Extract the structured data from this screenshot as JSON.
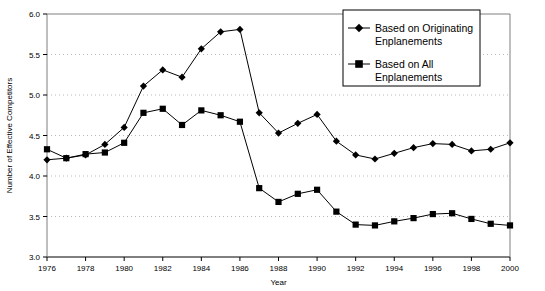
{
  "chart_data": {
    "type": "line",
    "title": "",
    "xlabel": "Year",
    "ylabel": "Number of Effective Competitors",
    "xlim": [
      1976,
      2000
    ],
    "ylim": [
      3.0,
      6.0
    ],
    "yticks": [
      "3.0",
      "3.5",
      "4.0",
      "4.5",
      "5.0",
      "5.5",
      "6.0"
    ],
    "ytick_values": [
      3.0,
      3.5,
      4.0,
      4.5,
      5.0,
      5.5,
      6.0
    ],
    "xticks": [
      "1976",
      "1978",
      "1980",
      "1982",
      "1984",
      "1986",
      "1988",
      "1990",
      "1992",
      "1994",
      "1996",
      "1998",
      "2000"
    ],
    "xtick_values": [
      1976,
      1978,
      1980,
      1982,
      1984,
      1986,
      1988,
      1990,
      1992,
      1994,
      1996,
      1998,
      2000
    ],
    "grid": "horizontal-dotted",
    "legend_position": "top-right",
    "x": [
      1976,
      1977,
      1978,
      1979,
      1980,
      1981,
      1982,
      1983,
      1984,
      1985,
      1986,
      1987,
      1988,
      1989,
      1990,
      1991,
      1992,
      1993,
      1994,
      1995,
      1996,
      1997,
      1998,
      1999,
      2000
    ],
    "series": [
      {
        "name": "Based on Originating Enplanements",
        "marker": "diamond",
        "color": "#000000",
        "values": [
          4.2,
          4.22,
          4.26,
          4.39,
          4.6,
          5.11,
          5.31,
          5.22,
          5.57,
          5.78,
          5.81,
          4.78,
          4.53,
          4.65,
          4.76,
          4.43,
          4.26,
          4.21,
          4.28,
          4.35,
          4.4,
          4.39,
          4.31,
          4.33,
          4.41
        ]
      },
      {
        "name": "Based on All Enplanements",
        "marker": "square",
        "color": "#000000",
        "values": [
          4.33,
          4.22,
          4.27,
          4.29,
          4.41,
          4.78,
          4.83,
          4.63,
          4.81,
          4.75,
          4.67,
          3.85,
          3.68,
          3.78,
          3.83,
          3.56,
          3.4,
          3.39,
          3.44,
          3.48,
          3.53,
          3.54,
          3.47,
          3.41,
          3.39
        ]
      }
    ]
  },
  "legend": {
    "items": [
      {
        "line1": "Based on Originating",
        "line2": "Enplanements",
        "marker": "diamond"
      },
      {
        "line1": "Based on All",
        "line2": "Enplanements",
        "marker": "square"
      }
    ]
  },
  "colors": {
    "series": "#000000",
    "grid": "#b9b9b9",
    "axis": "#7f7f7f",
    "background": "#ffffff"
  }
}
